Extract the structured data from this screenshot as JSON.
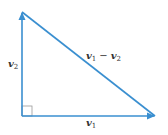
{
  "diagram": {
    "stroke_color": "#3a8fd0",
    "right_angle_color": "#9a9a9a",
    "vertices": {
      "origin": [
        22,
        116
      ],
      "top": [
        22,
        12
      ],
      "right": [
        155,
        116
      ]
    },
    "vectors": [
      {
        "name": "v1",
        "from": [
          22,
          116
        ],
        "to": [
          155,
          116
        ],
        "arrowhead": true
      },
      {
        "name": "v2",
        "from": [
          22,
          116
        ],
        "to": [
          22,
          12
        ],
        "arrowhead": true
      },
      {
        "name": "v1-v2",
        "from": [
          155,
          116
        ],
        "to": [
          22,
          12
        ],
        "arrowhead": false
      }
    ],
    "labels": {
      "v1": {
        "base": "v",
        "sub": "1"
      },
      "v2": {
        "base": "v",
        "sub": "2"
      },
      "diff": {
        "left_base": "v",
        "left_sub": "1",
        "operator": "−",
        "right_base": "v",
        "right_sub": "2"
      }
    },
    "right_angle_marker": {
      "x": 22,
      "y": 106,
      "size": 10
    }
  }
}
